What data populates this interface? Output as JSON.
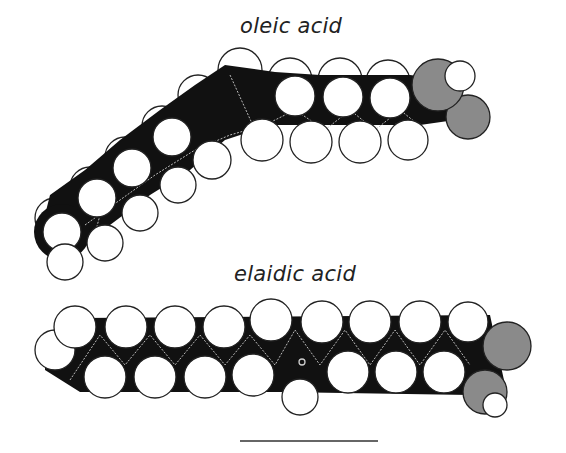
{
  "figure": {
    "title_oleic": "oleic acid",
    "title_elaidic": "elaidic acid",
    "scale_bar": {
      "x1": 240,
      "x2": 378,
      "y": 441
    }
  },
  "colors": {
    "carbon": "#111111",
    "hydrogen": "#ffffff",
    "oxygen": "#8a8a8a",
    "bond_lines": "#bbbbbb",
    "outline": "#222222"
  },
  "molecules": [
    {
      "name": "oleic acid",
      "isomer": "cis",
      "shape": "bent"
    },
    {
      "name": "elaidic acid",
      "isomer": "trans",
      "shape": "linear"
    }
  ]
}
